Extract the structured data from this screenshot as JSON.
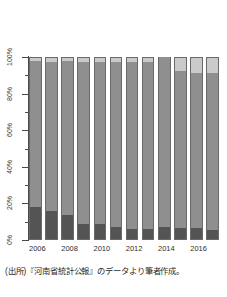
{
  "chart_data": {
    "type": "bar",
    "subtype": "100% stacked bar",
    "title": "",
    "xlabel": "",
    "ylabel": "",
    "ylim": [
      0,
      100
    ],
    "y_ticks": [
      "0%",
      "20%",
      "40%",
      "60%",
      "80%",
      "100%"
    ],
    "y_tick_values": [
      0,
      20,
      40,
      60,
      80,
      100
    ],
    "y_minor_tick_values": [
      10,
      30,
      50,
      70,
      90
    ],
    "grid": false,
    "legend": "none",
    "categories": [
      "2006",
      "2007",
      "2008",
      "2009",
      "2010",
      "2011",
      "2012",
      "2013",
      "2014",
      "2015",
      "2016",
      "2017"
    ],
    "x_tick_labels": [
      "2006",
      "",
      "2008",
      "",
      "2010",
      "",
      "2012",
      "",
      "2014",
      "",
      "2016",
      ""
    ],
    "series": [
      {
        "name": "primary",
        "color": "#545454",
        "values": [
          17.8,
          16.0,
          13.8,
          8.9,
          8.6,
          7.2,
          6.1,
          6.1,
          7.3,
          6.3,
          6.3,
          5.7
        ]
      },
      {
        "name": "secondary",
        "color": "#8f8f8f",
        "values": [
          79.9,
          81.5,
          83.8,
          88.4,
          88.8,
          90.3,
          91.4,
          91.4,
          92.7,
          86.0,
          85.1,
          85.5
        ]
      },
      {
        "name": "tertiary",
        "color": "#cacaca",
        "values": [
          2.3,
          2.5,
          2.4,
          2.7,
          2.6,
          2.5,
          2.5,
          2.5,
          0.0,
          7.7,
          8.6,
          8.8
        ]
      }
    ]
  },
  "caption": {
    "text": "(出所)『河南省統計公報』のデータより筆者作成。"
  }
}
